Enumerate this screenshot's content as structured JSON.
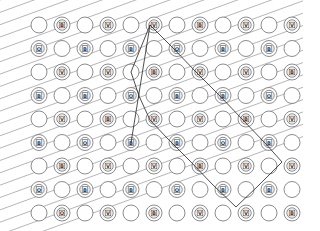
{
  "figure": {
    "type": "diagram",
    "width": 303,
    "height": 231,
    "background_color": "#ffffff"
  },
  "colors": {
    "background": "#ffffff",
    "hatch_line": "#8e8e93",
    "node_stroke": "#6f6f74",
    "node_fill": "#ffffff",
    "node_ring": "#5a5a5f",
    "glyph": "#3a3a3e",
    "path": "#2f2f33"
  },
  "grid": {
    "rows": 9,
    "columns": 12,
    "origin_x": 39,
    "origin_y": 25,
    "column_spacing": 23,
    "row_spacing": 23.5,
    "node_radius": 8,
    "inner_ring_radius": 5.2,
    "glyph_box_radius": 2.8,
    "pattern": "checkerboard",
    "description": "Circles alternate between plain (empty) and marked (with inner ring plus glyph) in a checkerboard arrangement."
  },
  "hatching": {
    "count": 22,
    "angle_degrees": -20,
    "spacing": 11.6,
    "stroke_width": 0.65,
    "direction": "down-right",
    "description": "Parallel diagonal rule lines descending left-to-right across the full field."
  },
  "glyphs": {
    "set": [
      "A",
      "B",
      "C",
      "D",
      "E",
      "F",
      "G",
      "H"
    ],
    "icon_names": [
      "lattice-node-a-icon",
      "lattice-node-b-icon",
      "lattice-node-c-icon",
      "lattice-node-d-icon",
      "lattice-node-e-icon",
      "lattice-node-f-icon",
      "lattice-node-g-icon",
      "lattice-node-h-icon"
    ],
    "rows": [
      [
        "",
        "B",
        "",
        "V",
        "",
        "V",
        "",
        "B",
        "",
        "V",
        "",
        "V"
      ],
      [
        "O",
        "",
        "B",
        "",
        "B",
        "",
        "O",
        "",
        "B",
        "",
        "B",
        ""
      ],
      [
        "",
        "V",
        "",
        "V",
        "",
        "B",
        "",
        "V",
        "",
        "V",
        "",
        "B"
      ],
      [
        "B",
        "",
        "B",
        "",
        "O",
        "",
        "B",
        "",
        "B",
        "",
        "O",
        ""
      ],
      [
        "",
        "V",
        "",
        "B",
        "",
        "V",
        "",
        "V",
        "",
        "B",
        "",
        "V"
      ],
      [
        "B",
        "",
        "O",
        "",
        "B",
        "",
        "B",
        "",
        "O",
        "",
        "B",
        ""
      ],
      [
        "",
        "B",
        "",
        "V",
        "",
        "V",
        "",
        "B",
        "",
        "V",
        "",
        "V"
      ],
      [
        "O",
        "",
        "B",
        "",
        "B",
        "",
        "O",
        "",
        "B",
        "",
        "B",
        ""
      ],
      [
        "",
        "O",
        "",
        "V",
        "",
        "B",
        "",
        "V",
        "",
        "V",
        "",
        "B"
      ]
    ]
  },
  "path": {
    "name": "traversal-path",
    "stroke_width": 0.85,
    "closed": false,
    "vertices": [
      {
        "x": 131,
        "y": 143
      },
      {
        "x": 150,
        "y": 25
      },
      {
        "x": 173,
        "y": 48
      },
      {
        "x": 196,
        "y": 72
      },
      {
        "x": 219,
        "y": 95
      },
      {
        "x": 242,
        "y": 119
      },
      {
        "x": 265,
        "y": 143
      },
      {
        "x": 282,
        "y": 162
      },
      {
        "x": 259,
        "y": 185
      },
      {
        "x": 236,
        "y": 207
      },
      {
        "x": 213,
        "y": 185
      },
      {
        "x": 190,
        "y": 161
      },
      {
        "x": 167,
        "y": 138
      },
      {
        "x": 150,
        "y": 120
      },
      {
        "x": 139,
        "y": 96
      },
      {
        "x": 131,
        "y": 72
      },
      {
        "x": 150,
        "y": 25
      }
    ],
    "segments_description": "An elongated V/diamond: from the apex node at top-center the path descends right along the node diagonal to the right-edge vertex, turns down-left to the bottom vertex, then climbs back up-left to close near the apex."
  },
  "legend": {
    "apex_label": "",
    "notes": ""
  }
}
